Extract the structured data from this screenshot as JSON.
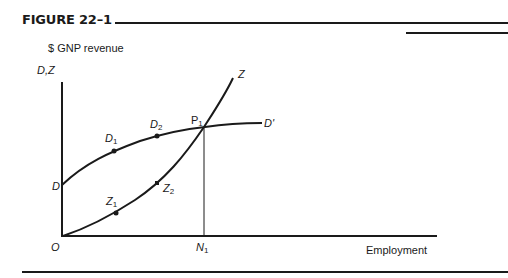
{
  "figure": {
    "title": "FIGURE 22–1",
    "y_axis_caption": "$ GNP revenue",
    "y_axis_label": "D,Z",
    "x_axis_label": "Employment",
    "origin_label": "O"
  },
  "curves": {
    "aggregate_demand": {
      "start_label": "D",
      "end_label": "D'"
    },
    "aggregate_supply": {
      "end_label": "Z"
    }
  },
  "points": {
    "D1": {
      "base": "D",
      "sub": "1"
    },
    "D2": {
      "base": "D",
      "sub": "2"
    },
    "Z1": {
      "base": "Z",
      "sub": "1"
    },
    "Z2": {
      "base": "Z",
      "sub": "2"
    },
    "P1": {
      "base": "P",
      "sub": "1"
    },
    "N1": {
      "base": "N",
      "sub": "1"
    }
  },
  "colors": {
    "ink": "#1a1a1a",
    "background": "#ffffff"
  }
}
